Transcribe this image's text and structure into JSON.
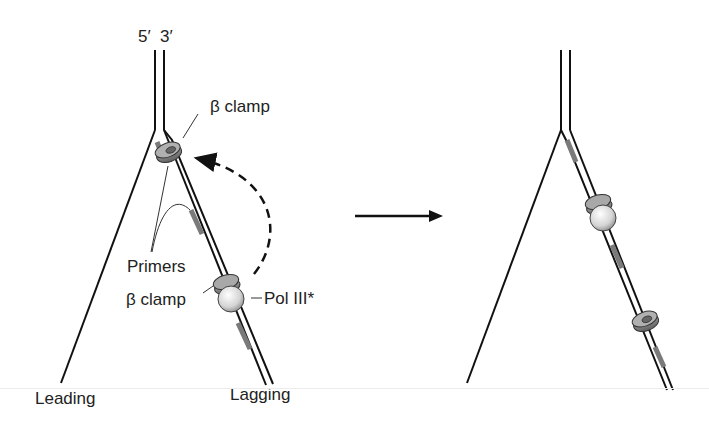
{
  "diagram": {
    "colors": {
      "strand": "#111111",
      "primer": "#7a7a7a",
      "clamp": "#8a8a8a",
      "polymerase": "#d8d8d8",
      "label": "#222222"
    },
    "left_panel": {
      "labels": {
        "five_prime": "5′",
        "three_prime": "3′",
        "clamp_top": "β clamp",
        "primers": "Primers",
        "clamp_bottom": "β clamp",
        "pol": "Pol III*",
        "leading": "Leading",
        "lagging": "Lagging"
      },
      "elements": [
        {
          "type": "parental-duplex",
          "label": "5′ 3′"
        },
        {
          "type": "leading-strand",
          "label": "Leading"
        },
        {
          "type": "lagging-strand",
          "label": "Lagging"
        },
        {
          "type": "beta-clamp",
          "position": "top",
          "label": "β clamp"
        },
        {
          "type": "primer",
          "count": 2,
          "label": "Primers"
        },
        {
          "type": "beta-clamp-with-pol",
          "position": "bottom",
          "label": "β clamp / Pol III*"
        },
        {
          "type": "dashed-arrow",
          "meaning": "Pol III* moves to upper clamp"
        }
      ]
    },
    "transition_arrow": "right-arrow",
    "right_panel": {
      "elements": [
        {
          "type": "parental-duplex"
        },
        {
          "type": "leading-strand"
        },
        {
          "type": "lagging-strand"
        },
        {
          "type": "primer",
          "count": 3
        },
        {
          "type": "beta-clamp-with-pol",
          "position": "upper"
        },
        {
          "type": "beta-clamp",
          "position": "lower",
          "note": "left behind"
        }
      ]
    }
  }
}
